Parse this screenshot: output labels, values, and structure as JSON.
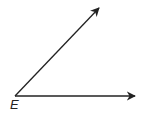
{
  "diagram": {
    "type": "angle",
    "vertex": {
      "label": "E",
      "x": 15,
      "y": 96
    },
    "rays": [
      {
        "name": "upper-ray",
        "to": {
          "x": 99,
          "y": 8
        }
      },
      {
        "name": "horizontal-ray",
        "to": {
          "x": 135,
          "y": 96
        }
      }
    ],
    "colors": {
      "stroke": "#222222",
      "background": "#ffffff"
    }
  }
}
